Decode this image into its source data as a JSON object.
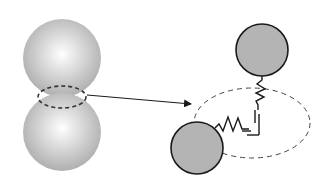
{
  "diagram": {
    "colors": {
      "background": "#ffffff",
      "sphere_highlight": "#ffffff",
      "sphere_shade": "#a8a8a8",
      "particle_fill": "#b4b4b4",
      "stroke": "#1a1a1a",
      "dash": "#333333"
    },
    "left_group": {
      "top_sphere": {
        "cx": 62,
        "cy": 58,
        "r": 39
      },
      "bottom_sphere": {
        "cx": 62,
        "cy": 132,
        "r": 39
      },
      "neck_ellipse": {
        "cx": 62,
        "cy": 97,
        "rx": 24,
        "ry": 11
      }
    },
    "arrow": {
      "x1": 87,
      "y1": 95,
      "x2": 192,
      "y2": 104
    },
    "right_group": {
      "bond_ellipse": {
        "cx": 252,
        "cy": 123,
        "rx": 58,
        "ry": 35
      },
      "upper_particle": {
        "cx": 262,
        "cy": 50,
        "r": 26
      },
      "lower_particle": {
        "cx": 197,
        "cy": 148,
        "r": 26
      },
      "elements": [
        "normal-spring",
        "normal-dashpot",
        "shear-spring",
        "shear-dashpot"
      ]
    }
  }
}
